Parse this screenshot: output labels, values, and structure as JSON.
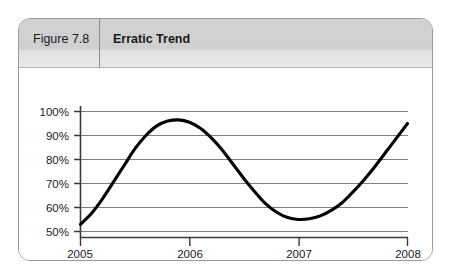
{
  "figure": {
    "number_label": "Figure 7.8",
    "title": "Erratic Trend"
  },
  "chart_data": {
    "type": "line",
    "title": "Erratic Trend",
    "xlabel": "",
    "ylabel": "",
    "xlim": [
      2005,
      2008
    ],
    "ylim": [
      50,
      100
    ],
    "grid": true,
    "legend": false,
    "x_tick_labels": [
      "2005",
      "2006",
      "2007",
      "2008"
    ],
    "x_ticks": [
      2005,
      2006,
      2007,
      2008
    ],
    "y_tick_labels": [
      "50%",
      "60%",
      "70%",
      "80%",
      "90%",
      "100%"
    ],
    "y_ticks": [
      50,
      60,
      70,
      80,
      90,
      100
    ],
    "line_color": "#000000",
    "line_width": 3,
    "grid_color": "#808080",
    "series": [
      {
        "name": "Trend",
        "x": [
          2005.0,
          2005.1,
          2005.2,
          2005.3,
          2005.4,
          2005.5,
          2005.6,
          2005.7,
          2005.8,
          2005.9,
          2006.0,
          2006.1,
          2006.2,
          2006.3,
          2006.4,
          2006.5,
          2006.6,
          2006.7,
          2006.8,
          2006.9,
          2007.0,
          2007.1,
          2007.2,
          2007.3,
          2007.4,
          2007.5,
          2007.6,
          2007.7,
          2007.8,
          2007.9,
          2008.0
        ],
        "values": [
          53.0,
          57.5,
          63.5,
          70.5,
          77.5,
          84.5,
          90.0,
          94.0,
          96.0,
          96.5,
          95.5,
          93.0,
          89.0,
          84.0,
          78.0,
          72.0,
          66.5,
          61.5,
          58.0,
          55.8,
          55.0,
          55.3,
          56.5,
          58.8,
          62.0,
          66.5,
          71.5,
          77.0,
          83.0,
          89.0,
          95.0
        ]
      }
    ],
    "annotations": {
      "start_value": 53,
      "peak_value": 96.5,
      "peak_x": 2005.9,
      "trough_value": 55,
      "trough_x": 2007.0,
      "end_value": 95
    }
  },
  "y_axis": {
    "labels": [
      "100%",
      "90%",
      "80%",
      "70%",
      "60%",
      "50%"
    ]
  },
  "x_axis": {
    "labels": [
      "2005",
      "2006",
      "2007",
      "2008"
    ]
  }
}
